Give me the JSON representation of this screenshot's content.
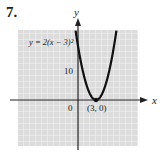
{
  "problem": {
    "number": "7."
  },
  "chart_data": {
    "type": "line",
    "title": "",
    "equation_label": "y = 2(x − 3)²",
    "xlabel": "x",
    "ylabel": "y",
    "origin_label": "0",
    "y_tick_labels": [
      {
        "value": 10,
        "label": "10"
      }
    ],
    "annotations": [
      {
        "x": 3,
        "y": 0,
        "label": "(3, 0)"
      }
    ],
    "series": [
      {
        "name": "y = 2(x − 3)²",
        "x": [
          -0.4,
          0,
          1,
          2,
          3,
          4,
          5,
          6,
          6.4
        ],
        "y": [
          23.1,
          18,
          8,
          2,
          0,
          2,
          8,
          18,
          23.1
        ]
      }
    ],
    "xlim": [
      -10,
      10
    ],
    "ylim": [
      -15,
      23
    ],
    "grid": true,
    "colors": {
      "grid_bg": "#dcdcdc",
      "grid_line": "#f4f4f4",
      "curve": "#111111",
      "axis": "#222222"
    }
  }
}
